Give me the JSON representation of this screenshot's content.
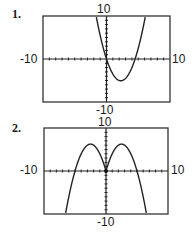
{
  "chart_data": [
    {
      "type": "line",
      "label": "1.",
      "function": "x*(x-4.5)",
      "xlim": [
        -10,
        10
      ],
      "ylim": [
        -10,
        10
      ],
      "tick_labels": {
        "x_min": "-10",
        "x_max": "10",
        "y_min": "-10",
        "y_max": "10"
      },
      "x_tick_step": 1,
      "y_tick_step": 1,
      "series": [
        {
          "name": "f",
          "points": [
            [
              -2.3,
              15.6
            ],
            [
              -1,
              5.5
            ],
            [
              0,
              0
            ],
            [
              1,
              -3.5
            ],
            [
              2.25,
              -5.06
            ],
            [
              3.5,
              -3.5
            ],
            [
              4.5,
              0
            ],
            [
              6,
              9
            ],
            [
              6.8,
              15.6
            ]
          ]
        }
      ]
    },
    {
      "type": "line",
      "label": "2.",
      "function": "-x^2+5|x|",
      "xlim": [
        -10,
        10
      ],
      "ylim": [
        -10,
        10
      ],
      "tick_labels": {
        "x_min": "-10",
        "x_max": "10",
        "y_min": "-10",
        "y_max": "10"
      },
      "x_tick_step": 1,
      "y_tick_step": 1,
      "series": [
        {
          "name": "f",
          "points": [
            [
              -7.2,
              -15.8
            ],
            [
              -5,
              0
            ],
            [
              -2.5,
              6.25
            ],
            [
              0,
              0
            ],
            [
              2.5,
              6.25
            ],
            [
              5,
              0
            ],
            [
              7.2,
              -15.8
            ]
          ]
        }
      ]
    }
  ]
}
